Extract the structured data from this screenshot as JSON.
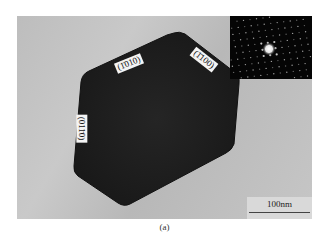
{
  "figure": {
    "type": "TEM micrograph",
    "caption": "(a)",
    "facet_labels": [
      {
        "text": "(1̄010)",
        "rotation_deg": -22
      },
      {
        "text": "(1̄100)",
        "rotation_deg": 38
      },
      {
        "text": "(011̄0)",
        "rotation_deg": 90
      }
    ],
    "inset": {
      "name": "selected-area-diffraction-pattern"
    },
    "scale_bar": {
      "label": "100nm"
    }
  },
  "colors": {
    "background": "#c2c2c2",
    "crystal": "#1e1e1e",
    "inset_bg": "#050505",
    "label_bg": "#f4f4f4"
  }
}
